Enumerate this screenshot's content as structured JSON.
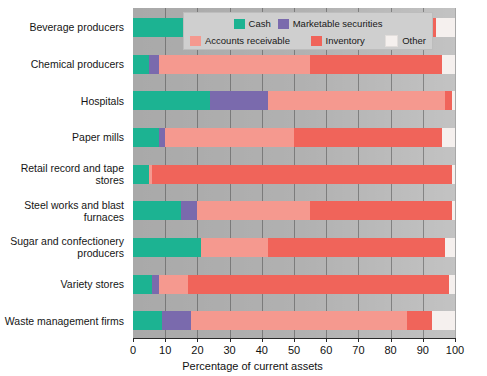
{
  "chart_data": {
    "type": "bar",
    "orientation": "horizontal",
    "stacked": true,
    "title": "",
    "xlabel": "Percentage of current assets",
    "ylabel": "",
    "xlim": [
      0,
      100
    ],
    "xticks": [
      0,
      10,
      20,
      30,
      40,
      50,
      60,
      70,
      80,
      90,
      100
    ],
    "grid": true,
    "legend_position": "top",
    "categories": [
      "Beverage producers",
      "Chemical producers",
      "Hospitals",
      "Paper mills",
      "Retail record and tape stores",
      "Steel works and blast furnaces",
      "Sugar and confectionery producers",
      "Variety stores",
      "Waste management firms"
    ],
    "series": [
      {
        "name": "Cash",
        "color": "#1cb392",
        "values": [
          23,
          5,
          24,
          8,
          5,
          15,
          21,
          6,
          9
        ]
      },
      {
        "name": "Marketable securities",
        "color": "#7a6aad",
        "values": [
          5,
          3,
          18,
          2,
          0,
          5,
          0,
          2,
          9
        ]
      },
      {
        "name": "Accounts receivable",
        "color": "#f5998f",
        "values": [
          26,
          47,
          55,
          40,
          1,
          35,
          21,
          9,
          67
        ]
      },
      {
        "name": "Inventory",
        "color": "#f0645a",
        "values": [
          40,
          41,
          2,
          46,
          93,
          44,
          55,
          81,
          8
        ]
      },
      {
        "name": "Other",
        "color": "#f5f0ee",
        "values": [
          6,
          4,
          1,
          4,
          1,
          1,
          3,
          2,
          7
        ]
      }
    ]
  },
  "legend": {
    "row1": [
      {
        "label": "Cash",
        "color": "#1cb392"
      },
      {
        "label": "Marketable securities",
        "color": "#7a6aad"
      }
    ],
    "row2": [
      {
        "label": "Accounts receivable",
        "color": "#f5998f"
      },
      {
        "label": "Inventory",
        "color": "#f0645a"
      },
      {
        "label": "Other",
        "color": "#f5f0ee"
      }
    ]
  },
  "axis": {
    "x_title": "Percentage of current assets",
    "x_ticks": [
      "0",
      "10",
      "20",
      "30",
      "40",
      "50",
      "60",
      "70",
      "80",
      "90",
      "100"
    ]
  },
  "colors": {
    "cash": "#1cb392",
    "marketable_securities": "#7a6aad",
    "accounts_receivable": "#f5998f",
    "inventory": "#f0645a",
    "other": "#f5f0ee",
    "plot_background": "#a9a9a9",
    "legend_background": "#cfcfcf"
  }
}
